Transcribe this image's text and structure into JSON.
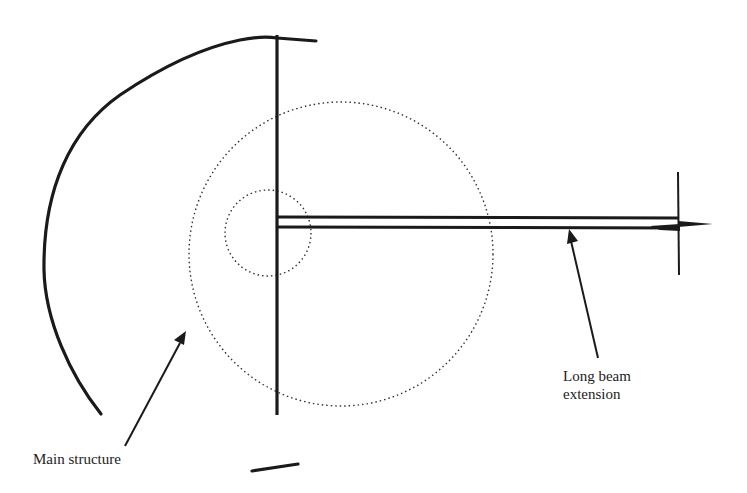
{
  "diagram": {
    "labels": {
      "main_structure": "Main structure",
      "long_beam_line1": "Long beam",
      "long_beam_line2": "extension"
    },
    "colors": {
      "stroke": "#1a1a1a",
      "dotted": "#333333",
      "background": "#ffffff"
    },
    "elements": {
      "large_circle": {
        "cx": 341,
        "cy": 254,
        "r": 152,
        "style": "dotted"
      },
      "small_circle": {
        "cx": 268,
        "cy": 233,
        "r": 43,
        "style": "dotted"
      },
      "vertical_axis": {
        "x": 277,
        "y1": 35,
        "y2": 415
      },
      "beam": {
        "x1": 277,
        "x2": 678,
        "y_top": 217,
        "y_bottom": 227
      },
      "end_cross": {
        "x": 678,
        "y1": 172,
        "y2": 275,
        "tip_x": 713
      }
    }
  }
}
